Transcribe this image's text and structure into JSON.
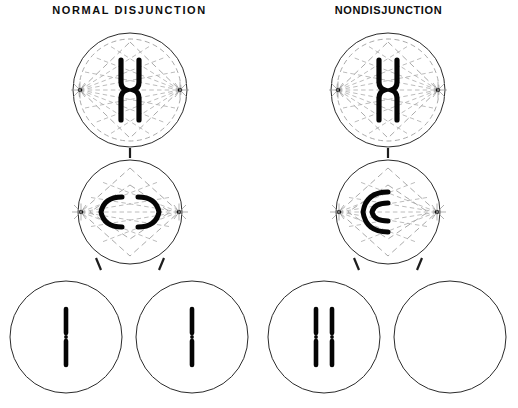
{
  "figure": {
    "width": 518,
    "height": 408,
    "background": "#ffffff",
    "ink_color": "#050505",
    "outline_color": "#2b2b2b",
    "spindle_color": "#9a9a9a"
  },
  "panels": [
    {
      "id": "normal",
      "title": "NORMAL DISJUNCTION",
      "center_x": 130,
      "stages": [
        {
          "name": "metaphase",
          "cell_cx": 130,
          "cell_cy": 90,
          "cell_r": 57,
          "chromosome": "x-shaped-dyad",
          "chromosome_count": 1
        },
        {
          "name": "anaphase",
          "cell_cx": 130,
          "cell_cy": 212,
          "cell_r": 52,
          "chromosome": "separated-chromatids",
          "chromosome_count": 2
        }
      ],
      "daughters": [
        {
          "name": "daughter-cell-left",
          "cell_cx": 66,
          "cell_cy": 337,
          "cell_r": 56,
          "chromosome_count": 1
        },
        {
          "name": "daughter-cell-right",
          "cell_cx": 192,
          "cell_cy": 337,
          "cell_r": 56,
          "chromosome_count": 1
        }
      ]
    },
    {
      "id": "nondisjunction",
      "title": "NONDISJUNCTION",
      "center_x": 388,
      "stages": [
        {
          "name": "metaphase",
          "cell_cx": 388,
          "cell_cy": 90,
          "cell_r": 57,
          "chromosome": "x-shaped-dyad",
          "chromosome_count": 1
        },
        {
          "name": "anaphase",
          "cell_cx": 388,
          "cell_cy": 212,
          "cell_r": 52,
          "chromosome": "both-chromatids-one-pole",
          "chromosome_count": 2
        }
      ],
      "daughters": [
        {
          "name": "daughter-cell-left",
          "cell_cx": 324,
          "cell_cy": 337,
          "cell_r": 56,
          "chromosome_count": 2
        },
        {
          "name": "daughter-cell-right",
          "cell_cx": 450,
          "cell_cy": 337,
          "cell_r": 56,
          "chromosome_count": 0
        }
      ]
    }
  ]
}
